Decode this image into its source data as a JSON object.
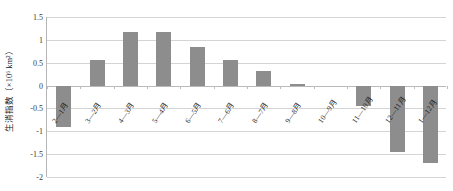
{
  "chart_data": {
    "type": "bar",
    "title": "",
    "subtitle": "",
    "xlabel": "",
    "ylabel": "生消指数（×10⁶ km²）",
    "categories": [
      "2—1月",
      "3—2月",
      "4—3月",
      "5—4月",
      "6—5月",
      "7—6月",
      "8—7月",
      "9—8月",
      "10—9月",
      "11—10月",
      "12—11月",
      "1—12月"
    ],
    "values": [
      -0.9,
      0.55,
      1.18,
      1.17,
      0.85,
      0.57,
      0.32,
      0.04,
      0.0,
      -0.45,
      -1.45,
      -1.7
    ],
    "ylim": [
      -2,
      1.5
    ],
    "ytick_labels": [
      "1.5",
      "1",
      "0.5",
      "0",
      "-0.5",
      "-1",
      "-1.5",
      "-2"
    ],
    "ytick_values": [
      1.5,
      1,
      0.5,
      0,
      -0.5,
      -1,
      -1.5,
      -2
    ],
    "grid": true,
    "legend": false,
    "legend_position": "none",
    "bar_color": "#8d8d8d",
    "gridline_color": "#d4d4d4",
    "axis_color": "#b6b6b6",
    "background_color": "#ffffff"
  }
}
